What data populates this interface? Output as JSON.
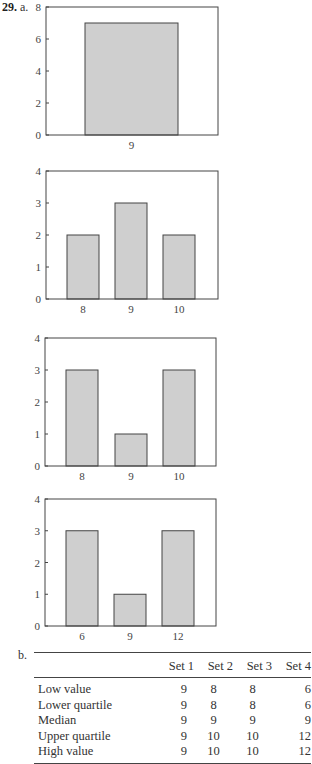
{
  "problem": {
    "number": "29.",
    "part_a_label": "a.",
    "part_b_label": "b."
  },
  "chart_data": [
    {
      "type": "bar",
      "title": "",
      "categories": [
        "9"
      ],
      "values": [
        7
      ],
      "xlabel": "",
      "ylabel": "",
      "ylim": [
        0,
        8
      ],
      "yticks": [
        0,
        2,
        4,
        6,
        8
      ],
      "grid": false,
      "bar_color": "#cfcfcf"
    },
    {
      "type": "bar",
      "title": "",
      "categories": [
        "8",
        "9",
        "10"
      ],
      "values": [
        2,
        3,
        2
      ],
      "xlabel": "",
      "ylabel": "",
      "ylim": [
        0,
        4
      ],
      "yticks": [
        0,
        1,
        2,
        3,
        4
      ],
      "grid": false,
      "bar_color": "#cfcfcf"
    },
    {
      "type": "bar",
      "title": "",
      "categories": [
        "8",
        "9",
        "10"
      ],
      "values": [
        3,
        1,
        3
      ],
      "xlabel": "",
      "ylabel": "",
      "ylim": [
        0,
        4
      ],
      "yticks": [
        0,
        1,
        2,
        3,
        4
      ],
      "grid": false,
      "bar_color": "#cfcfcf"
    },
    {
      "type": "bar",
      "title": "",
      "categories": [
        "6",
        "9",
        "12"
      ],
      "values": [
        3,
        1,
        3
      ],
      "xlabel": "",
      "ylabel": "",
      "ylim": [
        0,
        4
      ],
      "yticks": [
        0,
        1,
        2,
        3,
        4
      ],
      "grid": false,
      "bar_color": "#cfcfcf"
    }
  ],
  "table": {
    "type": "table",
    "columns": [
      "",
      "Set 1",
      "Set 2",
      "Set 3",
      "Set 4"
    ],
    "rows": [
      {
        "label": "Low value",
        "values": [
          "9",
          "8",
          "8",
          "6"
        ]
      },
      {
        "label": "Lower quartile",
        "values": [
          "9",
          "8",
          "8",
          "6"
        ]
      },
      {
        "label": "Median",
        "values": [
          "9",
          "9",
          "9",
          "9"
        ]
      },
      {
        "label": "Upper quartile",
        "values": [
          "9",
          "10",
          "10",
          "12"
        ]
      },
      {
        "label": "High value",
        "values": [
          "9",
          "10",
          "10",
          "12"
        ]
      }
    ]
  }
}
